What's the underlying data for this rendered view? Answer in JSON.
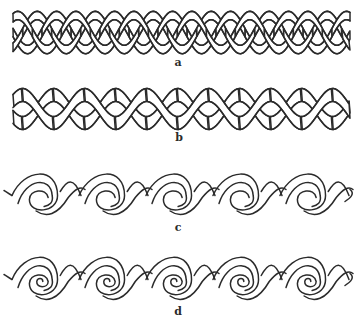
{
  "figure": {
    "line_color": "#2b2b2b",
    "background": "#ffffff"
  },
  "patterns": [
    {
      "id": "a",
      "label": "a",
      "kind": "three-strand-braid",
      "x0": 13,
      "x1": 350,
      "y_top": 12,
      "y_bottom": 53,
      "period": 58,
      "label_x": 178,
      "label_y": 56
    },
    {
      "id": "b",
      "label": "b",
      "kind": "two-strand-twist",
      "x0": 13,
      "x1": 350,
      "y_top": 86,
      "y_bottom": 130,
      "period": 62,
      "label_x": 179,
      "label_y": 131
    },
    {
      "id": "c",
      "label": "c",
      "kind": "running-scroll",
      "x0": 13,
      "x1": 350,
      "y_top": 172,
      "y_bottom": 215,
      "period": 67,
      "label_x": 178,
      "label_y": 221
    },
    {
      "id": "d",
      "label": "d",
      "kind": "running-spiral-scroll",
      "x0": 13,
      "x1": 350,
      "y_top": 255,
      "y_bottom": 300,
      "period": 67,
      "label_x": 178,
      "label_y": 305
    }
  ]
}
